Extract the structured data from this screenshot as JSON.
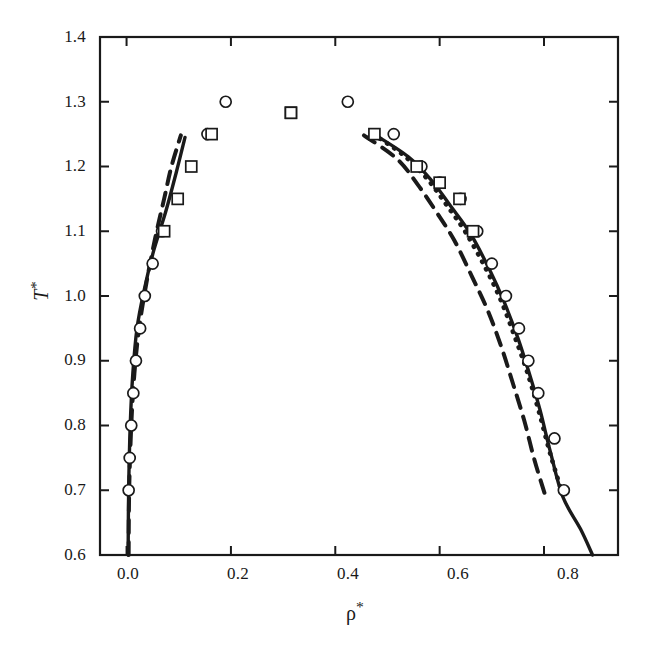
{
  "figure": {
    "background": "#ffffff",
    "ink": "#1a1a1a"
  },
  "axes": {
    "x_title_base": "ρ",
    "x_title_star": "*",
    "y_title_base": "T",
    "y_title_star": "*",
    "x_ticks": [
      "0.0",
      "0.2",
      "0.4",
      "0.6",
      "0.8"
    ],
    "y_ticks": [
      "1.4",
      "1.3",
      "1.2",
      "1.1",
      "1.0",
      "0.9",
      "0.8",
      "0.7",
      "0.6"
    ]
  },
  "chart_data": {
    "type": "scatter",
    "title": "",
    "xlabel": "ρ*",
    "ylabel": "T*",
    "xlim": [
      -0.0509,
      0.9418
    ],
    "ylim": [
      0.6,
      1.4
    ],
    "grid": false,
    "legend": "none",
    "xtick_values": [
      0.0,
      0.2,
      0.4,
      0.6,
      0.8
    ],
    "ytick_values": [
      0.6,
      0.7,
      0.8,
      0.9,
      1.0,
      1.1,
      1.2,
      1.3,
      1.4
    ],
    "series": [
      {
        "name": "circles-vapour-branch",
        "marker": "open-circle",
        "marker_size": 11,
        "points": [
          [
            0.004,
            0.7
          ],
          [
            0.006,
            0.75
          ],
          [
            0.009,
            0.8
          ],
          [
            0.013,
            0.85
          ],
          [
            0.018,
            0.9
          ],
          [
            0.026,
            0.95
          ],
          [
            0.035,
            1.0
          ],
          [
            0.05,
            1.05
          ],
          [
            0.068,
            1.1
          ],
          [
            0.155,
            1.25
          ],
          [
            0.19,
            1.3
          ]
        ]
      },
      {
        "name": "circles-liquid-branch",
        "marker": "open-circle",
        "marker_size": 11,
        "points": [
          [
            0.424,
            1.3
          ],
          [
            0.512,
            1.25
          ],
          [
            0.565,
            1.2
          ],
          [
            0.6,
            1.175
          ],
          [
            0.64,
            1.15
          ],
          [
            0.672,
            1.1
          ],
          [
            0.7,
            1.05
          ],
          [
            0.727,
            1.0
          ],
          [
            0.752,
            0.95
          ],
          [
            0.77,
            0.9
          ],
          [
            0.789,
            0.85
          ],
          [
            0.82,
            0.78
          ],
          [
            0.838,
            0.7
          ]
        ]
      },
      {
        "name": "squares-vapour-branch",
        "marker": "open-square",
        "marker_size": 11,
        "points": [
          [
            0.072,
            1.1
          ],
          [
            0.098,
            1.15
          ],
          [
            0.124,
            1.2
          ],
          [
            0.163,
            1.25
          ],
          [
            0.315,
            1.283
          ]
        ]
      },
      {
        "name": "squares-liquid-branch",
        "marker": "open-square",
        "marker_size": 11,
        "points": [
          [
            0.315,
            1.283
          ],
          [
            0.475,
            1.25
          ],
          [
            0.556,
            1.2
          ],
          [
            0.6,
            1.175
          ],
          [
            0.638,
            1.15
          ],
          [
            0.664,
            1.1
          ]
        ]
      },
      {
        "name": "solid-curve",
        "line": "solid",
        "points": [
          [
            0.003,
            0.6
          ],
          [
            0.004,
            0.7
          ],
          [
            0.007,
            0.8
          ],
          [
            0.012,
            0.88
          ],
          [
            0.02,
            0.95
          ],
          [
            0.034,
            1.01
          ],
          [
            0.052,
            1.07
          ],
          [
            0.075,
            1.13
          ],
          [
            0.095,
            1.19
          ],
          [
            0.112,
            1.245
          ],
          [
            0.47,
            1.252
          ],
          [
            0.54,
            1.215
          ],
          [
            0.585,
            1.178
          ],
          [
            0.62,
            1.14
          ],
          [
            0.66,
            1.095
          ],
          [
            0.696,
            1.04
          ],
          [
            0.724,
            0.99
          ],
          [
            0.75,
            0.935
          ],
          [
            0.772,
            0.88
          ],
          [
            0.792,
            0.825
          ],
          [
            0.812,
            0.76
          ],
          [
            0.836,
            0.69
          ],
          [
            0.87,
            0.64
          ],
          [
            0.893,
            0.6
          ]
        ]
      },
      {
        "name": "dotted-curve",
        "line": "dotted",
        "points": [
          [
            0.472,
            1.25
          ],
          [
            0.53,
            1.218
          ],
          [
            0.575,
            1.182
          ],
          [
            0.612,
            1.142
          ],
          [
            0.65,
            1.098
          ],
          [
            0.688,
            1.043
          ],
          [
            0.718,
            0.992
          ],
          [
            0.744,
            0.937
          ],
          [
            0.768,
            0.882
          ],
          [
            0.79,
            0.822
          ],
          [
            0.812,
            0.756
          ],
          [
            0.838,
            0.688
          ]
        ]
      },
      {
        "name": "dashed-curve",
        "line": "dashed",
        "points": [
          [
            0.004,
            0.6
          ],
          [
            0.005,
            0.7
          ],
          [
            0.009,
            0.8
          ],
          [
            0.015,
            0.88
          ],
          [
            0.024,
            0.95
          ],
          [
            0.038,
            1.02
          ],
          [
            0.055,
            1.09
          ],
          [
            0.072,
            1.15
          ],
          [
            0.086,
            1.2
          ],
          [
            0.104,
            1.248
          ],
          [
            0.455,
            1.248
          ],
          [
            0.518,
            1.212
          ],
          [
            0.558,
            1.172
          ],
          [
            0.592,
            1.132
          ],
          [
            0.628,
            1.086
          ],
          [
            0.662,
            1.03
          ],
          [
            0.692,
            0.978
          ],
          [
            0.718,
            0.922
          ],
          [
            0.74,
            0.866
          ],
          [
            0.762,
            0.808
          ],
          [
            0.782,
            0.746
          ],
          [
            0.804,
            0.688
          ]
        ]
      }
    ]
  }
}
